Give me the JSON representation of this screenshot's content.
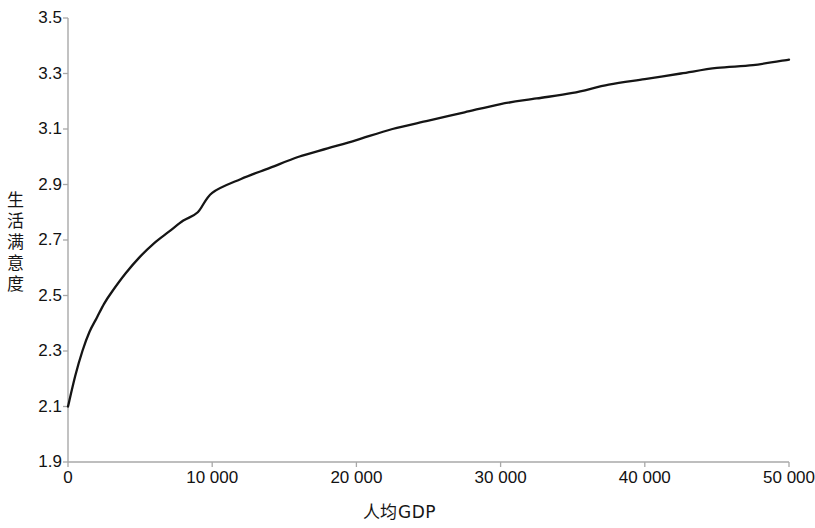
{
  "chart_data": {
    "type": "line",
    "title": "",
    "xlabel": "人均GDP",
    "ylabel": "生活满意度",
    "xlim": [
      0,
      50000
    ],
    "ylim": [
      1.9,
      3.5
    ],
    "grid": false,
    "legend": "none",
    "x_tick_labels": [
      "0",
      "10 000",
      "20 000",
      "30 000",
      "40 000",
      "50 000"
    ],
    "x_ticks": [
      0,
      10000,
      20000,
      30000,
      40000,
      50000
    ],
    "y_tick_labels": [
      "3.5",
      "3.3",
      "3.1",
      "2.9",
      "2.7",
      "2.5",
      "2.3",
      "2.1",
      "1.9"
    ],
    "y_ticks": [
      3.5,
      3.3,
      3.1,
      2.9,
      2.7,
      2.5,
      2.3,
      2.1,
      1.9
    ],
    "series": [
      {
        "name": "生活满意度",
        "color": "#151515",
        "x": [
          0,
          500,
          1000,
          1500,
          2000,
          2500,
          3000,
          4000,
          5000,
          6000,
          7000,
          8000,
          9000,
          10000,
          12000,
          14000,
          16000,
          18000,
          20000,
          22500,
          25000,
          27500,
          30000,
          32500,
          35000,
          37500,
          40000,
          42500,
          45000,
          47500,
          50000
        ],
        "y": [
          2.1,
          2.21,
          2.3,
          2.37,
          2.42,
          2.47,
          2.51,
          2.58,
          2.64,
          2.69,
          2.73,
          2.77,
          2.8,
          2.87,
          2.92,
          2.96,
          3.0,
          3.03,
          3.06,
          3.1,
          3.13,
          3.16,
          3.19,
          3.21,
          3.23,
          3.26,
          3.28,
          3.3,
          3.32,
          3.33,
          3.35
        ]
      }
    ]
  },
  "axes": {
    "y_axis_title": "生活满意度",
    "x_axis_title": "人均GDP"
  },
  "colors": {
    "curve": "#151515",
    "axis": "#a8a8a8",
    "background": "#ffffff",
    "text": "#121212"
  },
  "geometry": {
    "plot_left": 68,
    "plot_right": 789,
    "plot_top": 18,
    "plot_bottom": 462
  }
}
